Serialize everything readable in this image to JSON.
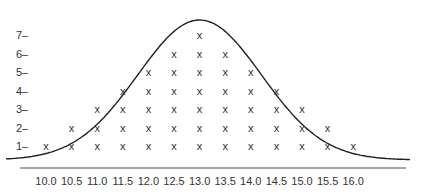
{
  "chart_data": {
    "type": "scatter",
    "subtype": "dot-plot-with-normal-curve",
    "title": "",
    "xlabel": "",
    "ylabel": "",
    "categories": [
      "10.0",
      "10.5",
      "11.0",
      "11.5",
      "12.0",
      "12.5",
      "13.0",
      "13.5",
      "14.0",
      "14.5",
      "15.0",
      "15.5",
      "16.0"
    ],
    "values": [
      1,
      2,
      3,
      4,
      5,
      6,
      7,
      6,
      5,
      4,
      3,
      2,
      1
    ],
    "y_ticks": [
      "1",
      "2",
      "3",
      "4",
      "5",
      "6",
      "7"
    ],
    "ylim": [
      0,
      7.5
    ],
    "marker": "x",
    "overlay": {
      "type": "normal-curve",
      "mean": 13.0
    },
    "grid": false,
    "legend": null,
    "colors": {
      "line": "#222222",
      "axis": "#888888",
      "marker": "#333333"
    }
  }
}
